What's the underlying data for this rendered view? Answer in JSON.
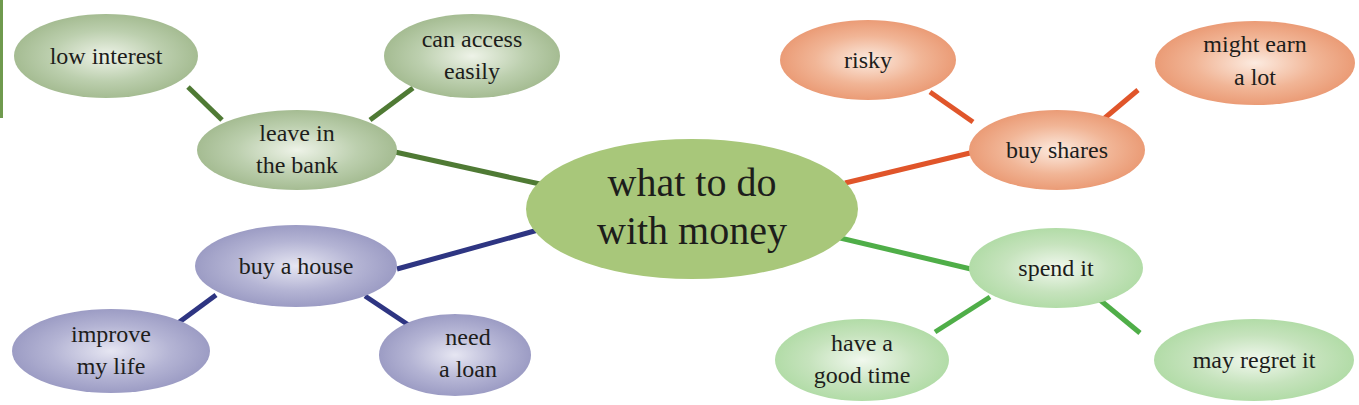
{
  "diagram": {
    "type": "mind-map",
    "colors": {
      "savings_green": "#a9c094",
      "savings_line": "#4f7a34",
      "shares_orange": "#eca07c",
      "shares_line": "#e0552a",
      "house_purple": "#a3a3c8",
      "house_line": "#2e3582",
      "spend_green": "#b8dcae",
      "spend_line": "#4fae48",
      "center_green": "#a8c77a",
      "left_bar": "#6f9a4e"
    },
    "center": {
      "id": "center",
      "lines": [
        "what to do",
        "with money"
      ]
    },
    "branches": [
      {
        "id": "leave-in-the-bank",
        "lines": [
          "leave in",
          "the bank"
        ],
        "children": [
          {
            "id": "low-interest",
            "lines": [
              "low interest"
            ]
          },
          {
            "id": "can-access-easily",
            "lines": [
              "can access",
              "easily"
            ]
          }
        ]
      },
      {
        "id": "buy-shares",
        "lines": [
          "buy shares"
        ],
        "children": [
          {
            "id": "risky",
            "lines": [
              "risky"
            ]
          },
          {
            "id": "might-earn-a-lot",
            "lines": [
              "might earn",
              "a lot"
            ]
          }
        ]
      },
      {
        "id": "buy-a-house",
        "lines": [
          "buy a house"
        ],
        "children": [
          {
            "id": "improve-my-life",
            "lines": [
              "improve",
              "my life"
            ]
          },
          {
            "id": "need-a-loan",
            "lines": [
              "need",
              "a loan"
            ]
          }
        ]
      },
      {
        "id": "spend-it",
        "lines": [
          "spend it"
        ],
        "children": [
          {
            "id": "have-a-good-time",
            "lines": [
              "have a",
              "good time"
            ]
          },
          {
            "id": "may-regret-it",
            "lines": [
              "may regret it"
            ]
          }
        ]
      }
    ]
  }
}
